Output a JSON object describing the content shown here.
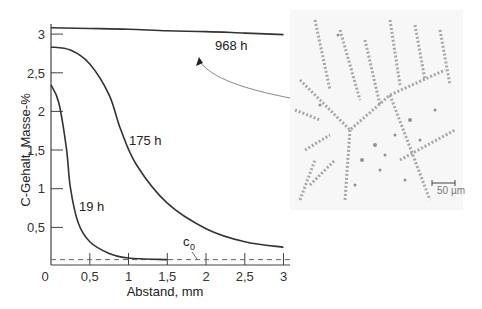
{
  "chart_data": {
    "type": "line",
    "title": "",
    "xlabel": "Abstand, mm",
    "ylabel": "C-Gehalt, Masse-%",
    "xlim": [
      0,
      3
    ],
    "ylim": [
      0,
      3.1
    ],
    "grid": false,
    "x_ticks": [
      "0",
      "0,5",
      "1",
      "1,5",
      "2",
      "2,5",
      "3"
    ],
    "y_ticks": [
      "0,5",
      "1",
      "1,5",
      "2",
      "2,5",
      "3"
    ],
    "series": [
      {
        "name": "968 h",
        "x": [
          0,
          0.5,
          1,
          1.5,
          2,
          2.5,
          3
        ],
        "values": [
          3.07,
          3.06,
          3.05,
          3.03,
          3.02,
          3.0,
          2.98
        ]
      },
      {
        "name": "175 h",
        "x": [
          0,
          0.25,
          0.5,
          0.75,
          0.9,
          1.1,
          1.5,
          2,
          2.5,
          3
        ],
        "values": [
          2.82,
          2.78,
          2.6,
          2.2,
          1.75,
          1.3,
          0.8,
          0.47,
          0.3,
          0.23
        ]
      },
      {
        "name": "19 h",
        "x": [
          0,
          0.1,
          0.2,
          0.25,
          0.35,
          0.5,
          0.75,
          1,
          1.5
        ],
        "values": [
          2.33,
          2.1,
          1.5,
          1.0,
          0.55,
          0.3,
          0.15,
          0.09,
          0.07
        ]
      }
    ],
    "reference_lines": [
      {
        "name": "c0",
        "label": "c",
        "subscript": "0",
        "y": 0.07,
        "style": "dashed"
      }
    ],
    "annotations": [
      {
        "text": "968 h",
        "note": "arrow from micrograph points to 968 h curve"
      },
      {
        "text": "50 µm",
        "note": "scale bar on micrograph"
      }
    ]
  },
  "labels": {
    "x_axis_title": "Abstand, mm",
    "y_axis_title": "C-Gehalt, Masse-%",
    "curve_968": "968 h",
    "curve_175": "175 h",
    "curve_19": "19 h",
    "c0_main": "c",
    "c0_sub": "0",
    "origin": "0",
    "xt1": "0,5",
    "xt2": "1",
    "xt3": "1,5",
    "xt4": "2",
    "xt5": "2,5",
    "xt6": "3",
    "yt1": "0,5",
    "yt2": "1",
    "yt3": "1,5",
    "yt4": "2",
    "yt5": "2,5",
    "yt6": "3",
    "scale_bar": "50 µm"
  }
}
